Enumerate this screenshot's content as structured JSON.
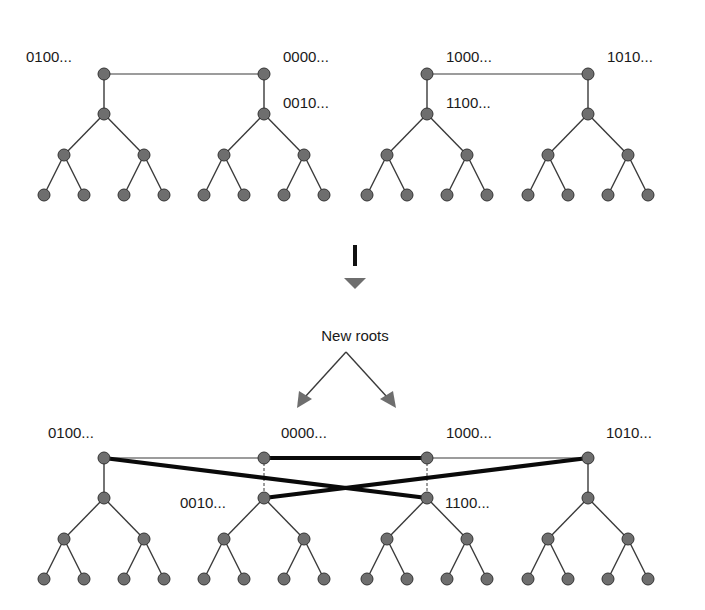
{
  "diagram": {
    "colors": {
      "node_fill": "#6e6e6e",
      "node_stroke": "#333333",
      "edge": "#3a3a3a",
      "thick_edge": "#0a0a0a",
      "arrow": "#6e6e6e"
    },
    "top": {
      "labels": [
        {
          "text": "0100...",
          "x": 26,
          "y": 62
        },
        {
          "text": "0000...",
          "x": 283,
          "y": 62
        },
        {
          "text": "0010...",
          "x": 283,
          "y": 108
        },
        {
          "text": "1000...",
          "x": 446,
          "y": 62
        },
        {
          "text": "1100...",
          "x": 446,
          "y": 108
        },
        {
          "text": "1010...",
          "x": 607,
          "y": 62
        }
      ],
      "root_links": [
        {
          "from": 0,
          "to": 1
        },
        {
          "from": 2,
          "to": 3
        }
      ],
      "tree_roots_x": [
        104,
        264,
        427,
        588
      ],
      "levels_y": [
        74,
        114,
        155,
        195
      ]
    },
    "transition": {
      "arrow_label": "New roots",
      "arrow_label_x": 355,
      "arrow_label_y": 341
    },
    "bottom": {
      "labels": [
        {
          "text": "0100...",
          "x": 48,
          "y": 438
        },
        {
          "text": "0000...",
          "x": 281,
          "y": 438
        },
        {
          "text": "1000...",
          "x": 446,
          "y": 438
        },
        {
          "text": "1010...",
          "x": 606,
          "y": 438
        },
        {
          "text": "0010...",
          "x": 180,
          "y": 508
        },
        {
          "text": "1100...",
          "x": 445,
          "y": 508
        }
      ],
      "tree_roots_x": [
        104,
        264,
        427,
        588
      ],
      "levels_y": [
        458,
        498,
        539,
        579
      ],
      "new_roots_note": "Roots 0000... and 1000... are detached (dashed) from their former subtrees 0010... and 1100..."
    }
  }
}
